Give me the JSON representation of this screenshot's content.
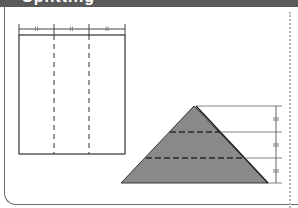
{
  "header": {
    "title": "Splitting",
    "background": "#5a5a5a"
  },
  "figures": [
    {
      "name": "rectangle-split-into-three-equal-columns",
      "shape": "rectangle",
      "divisions": 3,
      "orientation": "vertical",
      "equal_marks": [
        "||",
        "||",
        "||"
      ],
      "fill": "#ffffff"
    },
    {
      "name": "triangle-split-into-three-equal-heights",
      "shape": "triangle",
      "divisions": 3,
      "orientation": "horizontal",
      "equal_marks": [
        "=",
        "=",
        "="
      ],
      "fill": "#8a8a8a"
    }
  ],
  "colors": {
    "line": "#333333",
    "triangle_fill": "#8a8a8a",
    "dotted_separator": "#b5b5b5"
  }
}
